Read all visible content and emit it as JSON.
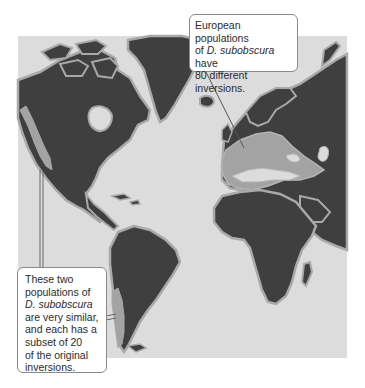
{
  "figure": {
    "colors": {
      "ocean": "#dcdcdc",
      "land": "#3f3f3f",
      "coast_outline": "#a9a9a9",
      "highlight_region": "#a3a3a3",
      "callout_border": "#8a8a8a",
      "callout_text": "#2b2b2b"
    },
    "regions": [
      {
        "name": "Europe and Mediterranean",
        "highlighted": true
      },
      {
        "name": "Western North America",
        "highlighted": true
      },
      {
        "name": "Western South America (Chile)",
        "highlighted": true
      }
    ]
  },
  "callouts": {
    "europe": {
      "line1": "European populations",
      "line2_prefix": "of ",
      "line2_species": "D. subobscura",
      "line2_suffix": " have",
      "line3": "80 different inversions."
    },
    "americas": {
      "line1": "These two",
      "line2": "populations of",
      "line3_species": "D. subobscura",
      "line4": "are very similar,",
      "line5": "and each has a",
      "line6": "subset of 20",
      "line7": "of the original",
      "line8": "inversions."
    }
  }
}
